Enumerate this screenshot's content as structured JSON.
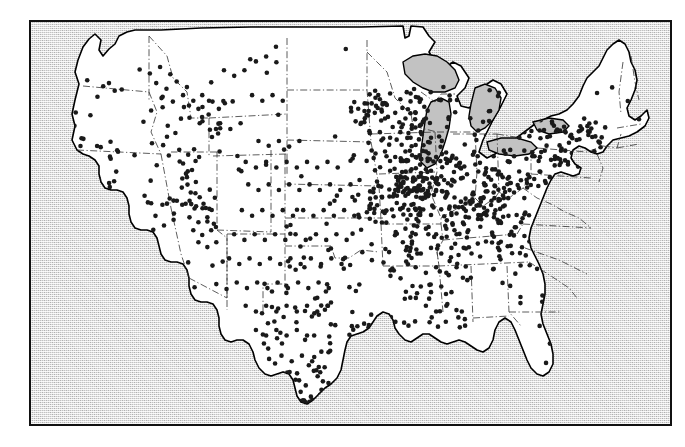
{
  "figure": {
    "frame": {
      "border_color": "#111111",
      "background_color": "#c2c2c2",
      "land_fill_color": "#ffffff",
      "land_outline_color": "#000000",
      "state_border_color": "#333333",
      "dot_color": "#1a1a1a",
      "dot_radius_px": 2.3
    },
    "legend": {
      "present": false,
      "items": []
    },
    "axes": {
      "present": false
    },
    "labels": {
      "present": false,
      "items": []
    }
  },
  "chart_data": {
    "type": "scatter",
    "subtitle": "",
    "xlabel": "",
    "ylabel": "",
    "grid": false,
    "legend_position": "none",
    "projection": "conic (Albers-like)",
    "extent_note": "Contiguous 48 states; Alaska and Hawaii not shown",
    "total_points": 1180,
    "density_summary": [
      {
        "region": "Upper Midwest / Great Lakes (WI, IL, IN, OH, MI, lower MN, IA)",
        "density": "very high"
      },
      {
        "region": "Ohio Valley / Kentucky / Tennessee",
        "density": "high"
      },
      {
        "region": "Mid-Atlantic / Upstate New York / Pennsylvania",
        "density": "high"
      },
      {
        "region": "Central and Eastern Texas / Gulf Coast",
        "density": "moderate-high"
      },
      {
        "region": "California Central Valley and coast",
        "density": "moderate-high"
      },
      {
        "region": "Missouri / Arkansas / Oklahoma / Kansas",
        "density": "moderate"
      },
      {
        "region": "Utah / Idaho / Colorado Front Range",
        "density": "moderate"
      },
      {
        "region": "Mississippi / Alabama / Louisiana",
        "density": "moderate"
      },
      {
        "region": "Montana / Dakotas / Wyoming / Nevada / Great Basin",
        "density": "low"
      },
      {
        "region": "Florida / Georgia / the Carolinas",
        "density": "low"
      },
      {
        "region": "Northern New England (ME, NH, VT)",
        "density": "very low"
      }
    ],
    "clusters": [
      {
        "name": "Chicago–Milwaukee corridor",
        "approx_x": 0.62,
        "approx_y": 0.36,
        "weight": "very high"
      },
      {
        "name": "Central Illinois / Iowa",
        "approx_x": 0.58,
        "approx_y": 0.44,
        "weight": "very high"
      },
      {
        "name": "Ohio / Indiana",
        "approx_x": 0.7,
        "approx_y": 0.42,
        "weight": "very high"
      },
      {
        "name": "Southern Wisconsin / Minnesota",
        "approx_x": 0.57,
        "approx_y": 0.24,
        "weight": "high"
      },
      {
        "name": "New York / New Jersey metro",
        "approx_x": 0.85,
        "approx_y": 0.3,
        "weight": "high"
      },
      {
        "name": "South Texas / Rio Grande Valley",
        "approx_x": 0.43,
        "approx_y": 0.92,
        "weight": "high"
      },
      {
        "name": "California Bay Area",
        "approx_x": 0.07,
        "approx_y": 0.44,
        "weight": "high"
      },
      {
        "name": "Utah Wasatch Front",
        "approx_x": 0.23,
        "approx_y": 0.43,
        "weight": "moderate"
      }
    ],
    "points": [
      [
        0.088,
        0.145
      ],
      [
        0.113,
        0.16
      ],
      [
        0.122,
        0.152
      ],
      [
        0.131,
        0.171
      ],
      [
        0.104,
        0.186
      ],
      [
        0.142,
        0.168
      ],
      [
        0.07,
        0.225
      ],
      [
        0.093,
        0.232
      ],
      [
        0.068,
        0.258
      ],
      [
        0.054,
        0.3
      ],
      [
        0.06,
        0.318
      ],
      [
        0.072,
        0.33
      ],
      [
        0.049,
        0.34
      ],
      [
        0.063,
        0.352
      ],
      [
        0.078,
        0.344
      ],
      [
        0.055,
        0.366
      ],
      [
        0.07,
        0.378
      ],
      [
        0.086,
        0.37
      ],
      [
        0.046,
        0.392
      ],
      [
        0.062,
        0.404
      ],
      [
        0.079,
        0.398
      ],
      [
        0.094,
        0.388
      ],
      [
        0.053,
        0.418
      ],
      [
        0.068,
        0.43
      ],
      [
        0.084,
        0.424
      ],
      [
        0.1,
        0.414
      ],
      [
        0.058,
        0.444
      ],
      [
        0.074,
        0.456
      ],
      [
        0.09,
        0.45
      ],
      [
        0.106,
        0.44
      ],
      [
        0.064,
        0.47
      ],
      [
        0.08,
        0.482
      ],
      [
        0.096,
        0.476
      ],
      [
        0.112,
        0.466
      ],
      [
        0.072,
        0.496
      ],
      [
        0.088,
        0.508
      ],
      [
        0.104,
        0.502
      ],
      [
        0.12,
        0.492
      ],
      [
        0.082,
        0.522
      ],
      [
        0.098,
        0.534
      ],
      [
        0.114,
        0.528
      ],
      [
        0.092,
        0.548
      ],
      [
        0.108,
        0.56
      ],
      [
        0.124,
        0.554
      ],
      [
        0.104,
        0.576
      ],
      [
        0.12,
        0.588
      ],
      [
        0.136,
        0.582
      ],
      [
        0.118,
        0.604
      ],
      [
        0.134,
        0.616
      ],
      [
        0.15,
        0.61
      ],
      [
        0.132,
        0.632
      ],
      [
        0.148,
        0.644
      ],
      [
        0.146,
        0.664
      ],
      [
        0.162,
        0.672
      ],
      [
        0.158,
        0.692
      ],
      [
        0.174,
        0.7
      ],
      [
        0.172,
        0.718
      ],
      [
        0.186,
        0.726
      ],
      [
        0.196,
        0.742
      ],
      [
        0.188,
        0.22
      ],
      [
        0.206,
        0.212
      ],
      [
        0.176,
        0.248
      ],
      [
        0.214,
        0.258
      ],
      [
        0.226,
        0.276
      ],
      [
        0.232,
        0.318
      ],
      [
        0.246,
        0.33
      ],
      [
        0.238,
        0.352
      ],
      [
        0.252,
        0.368
      ],
      [
        0.244,
        0.386
      ],
      [
        0.258,
        0.398
      ],
      [
        0.236,
        0.412
      ],
      [
        0.25,
        0.424
      ],
      [
        0.264,
        0.436
      ],
      [
        0.242,
        0.452
      ],
      [
        0.256,
        0.464
      ],
      [
        0.27,
        0.452
      ],
      [
        0.248,
        0.486
      ],
      [
        0.262,
        0.498
      ],
      [
        0.276,
        0.486
      ],
      [
        0.254,
        0.518
      ],
      [
        0.268,
        0.53
      ],
      [
        0.282,
        0.518
      ],
      [
        0.262,
        0.548
      ],
      [
        0.276,
        0.56
      ],
      [
        0.29,
        0.548
      ],
      [
        0.246,
        0.598
      ],
      [
        0.284,
        0.606
      ],
      [
        0.3,
        0.596
      ],
      [
        0.216,
        0.648
      ],
      [
        0.256,
        0.66
      ],
      [
        0.29,
        0.652
      ],
      [
        0.306,
        0.664
      ],
      [
        0.17,
        0.118
      ],
      [
        0.186,
        0.128
      ],
      [
        0.202,
        0.112
      ],
      [
        0.218,
        0.13
      ],
      [
        0.196,
        0.152
      ],
      [
        0.212,
        0.166
      ],
      [
        0.228,
        0.148
      ],
      [
        0.244,
        0.162
      ],
      [
        0.206,
        0.186
      ],
      [
        0.222,
        0.198
      ],
      [
        0.238,
        0.182
      ],
      [
        0.254,
        0.196
      ],
      [
        0.268,
        0.182
      ],
      [
        0.284,
        0.198
      ],
      [
        0.262,
        0.216
      ],
      [
        0.278,
        0.23
      ],
      [
        0.294,
        0.216
      ],
      [
        0.248,
        0.238
      ],
      [
        0.264,
        0.252
      ],
      [
        0.28,
        0.268
      ],
      [
        0.296,
        0.252
      ],
      [
        0.312,
        0.266
      ],
      [
        0.328,
        0.252
      ],
      [
        0.302,
        0.12
      ],
      [
        0.318,
        0.134
      ],
      [
        0.334,
        0.12
      ],
      [
        0.352,
        0.098
      ],
      [
        0.368,
        0.086
      ],
      [
        0.384,
        0.1
      ],
      [
        0.346,
        0.182
      ],
      [
        0.362,
        0.196
      ],
      [
        0.378,
        0.182
      ],
      [
        0.394,
        0.196
      ],
      [
        0.356,
        0.296
      ],
      [
        0.372,
        0.308
      ],
      [
        0.388,
        0.296
      ],
      [
        0.404,
        0.31
      ],
      [
        0.42,
        0.296
      ],
      [
        0.336,
        0.348
      ],
      [
        0.352,
        0.362
      ],
      [
        0.368,
        0.348
      ],
      [
        0.384,
        0.362
      ],
      [
        0.4,
        0.348
      ],
      [
        0.416,
        0.362
      ],
      [
        0.432,
        0.348
      ],
      [
        0.448,
        0.362
      ],
      [
        0.464,
        0.348
      ],
      [
        0.48,
        0.362
      ],
      [
        0.34,
        0.404
      ],
      [
        0.356,
        0.418
      ],
      [
        0.372,
        0.404
      ],
      [
        0.388,
        0.418
      ],
      [
        0.404,
        0.404
      ],
      [
        0.42,
        0.418
      ],
      [
        0.436,
        0.404
      ],
      [
        0.452,
        0.418
      ],
      [
        0.468,
        0.404
      ],
      [
        0.484,
        0.418
      ],
      [
        0.5,
        0.404
      ],
      [
        0.33,
        0.468
      ],
      [
        0.346,
        0.482
      ],
      [
        0.362,
        0.468
      ],
      [
        0.378,
        0.482
      ],
      [
        0.394,
        0.468
      ],
      [
        0.41,
        0.482
      ],
      [
        0.426,
        0.468
      ],
      [
        0.442,
        0.482
      ],
      [
        0.458,
        0.468
      ],
      [
        0.474,
        0.482
      ],
      [
        0.49,
        0.468
      ],
      [
        0.506,
        0.482
      ],
      [
        0.318,
        0.528
      ],
      [
        0.334,
        0.542
      ],
      [
        0.35,
        0.528
      ],
      [
        0.366,
        0.542
      ],
      [
        0.382,
        0.528
      ],
      [
        0.398,
        0.542
      ],
      [
        0.414,
        0.528
      ],
      [
        0.43,
        0.542
      ],
      [
        0.446,
        0.528
      ],
      [
        0.462,
        0.542
      ],
      [
        0.478,
        0.528
      ],
      [
        0.494,
        0.542
      ],
      [
        0.31,
        0.588
      ],
      [
        0.326,
        0.602
      ],
      [
        0.342,
        0.588
      ],
      [
        0.358,
        0.602
      ],
      [
        0.374,
        0.588
      ],
      [
        0.39,
        0.602
      ],
      [
        0.406,
        0.588
      ],
      [
        0.422,
        0.602
      ],
      [
        0.438,
        0.588
      ],
      [
        0.454,
        0.602
      ],
      [
        0.47,
        0.588
      ],
      [
        0.486,
        0.602
      ],
      [
        0.322,
        0.648
      ],
      [
        0.338,
        0.662
      ],
      [
        0.354,
        0.648
      ],
      [
        0.37,
        0.662
      ],
      [
        0.386,
        0.648
      ],
      [
        0.402,
        0.662
      ],
      [
        0.418,
        0.648
      ],
      [
        0.434,
        0.662
      ],
      [
        0.45,
        0.648
      ],
      [
        0.466,
        0.662
      ],
      [
        0.336,
        0.706
      ],
      [
        0.352,
        0.72
      ],
      [
        0.368,
        0.706
      ],
      [
        0.384,
        0.72
      ],
      [
        0.4,
        0.706
      ],
      [
        0.416,
        0.72
      ],
      [
        0.432,
        0.706
      ],
      [
        0.448,
        0.72
      ],
      [
        0.464,
        0.706
      ],
      [
        0.352,
        0.766
      ],
      [
        0.368,
        0.78
      ],
      [
        0.384,
        0.766
      ],
      [
        0.4,
        0.78
      ],
      [
        0.416,
        0.766
      ],
      [
        0.432,
        0.78
      ],
      [
        0.392,
        0.83
      ],
      [
        0.408,
        0.844
      ],
      [
        0.424,
        0.83
      ],
      [
        0.44,
        0.844
      ],
      [
        0.414,
        0.89
      ],
      [
        0.43,
        0.904
      ],
      [
        0.422,
        0.92
      ],
      [
        0.438,
        0.932
      ],
      [
        0.43,
        0.946
      ],
      [
        0.53,
        0.18
      ],
      [
        0.546,
        0.192
      ],
      [
        0.562,
        0.178
      ],
      [
        0.578,
        0.192
      ],
      [
        0.594,
        0.178
      ],
      [
        0.61,
        0.192
      ],
      [
        0.538,
        0.226
      ],
      [
        0.554,
        0.24
      ],
      [
        0.57,
        0.226
      ],
      [
        0.586,
        0.24
      ],
      [
        0.602,
        0.226
      ],
      [
        0.618,
        0.24
      ],
      [
        0.546,
        0.274
      ],
      [
        0.562,
        0.288
      ],
      [
        0.578,
        0.274
      ],
      [
        0.594,
        0.288
      ],
      [
        0.61,
        0.274
      ],
      [
        0.626,
        0.288
      ],
      [
        0.554,
        0.322
      ],
      [
        0.57,
        0.336
      ],
      [
        0.586,
        0.322
      ],
      [
        0.602,
        0.336
      ],
      [
        0.618,
        0.322
      ],
      [
        0.634,
        0.336
      ],
      [
        0.562,
        0.37
      ],
      [
        0.578,
        0.384
      ],
      [
        0.594,
        0.37
      ],
      [
        0.61,
        0.384
      ],
      [
        0.626,
        0.37
      ],
      [
        0.642,
        0.384
      ],
      [
        0.57,
        0.418
      ],
      [
        0.586,
        0.432
      ],
      [
        0.602,
        0.418
      ],
      [
        0.618,
        0.432
      ],
      [
        0.634,
        0.418
      ],
      [
        0.65,
        0.432
      ],
      [
        0.578,
        0.466
      ],
      [
        0.594,
        0.48
      ],
      [
        0.61,
        0.466
      ],
      [
        0.626,
        0.48
      ],
      [
        0.642,
        0.466
      ],
      [
        0.658,
        0.48
      ],
      [
        0.586,
        0.514
      ],
      [
        0.602,
        0.528
      ],
      [
        0.618,
        0.514
      ],
      [
        0.634,
        0.528
      ],
      [
        0.65,
        0.514
      ],
      [
        0.666,
        0.528
      ],
      [
        0.594,
        0.562
      ],
      [
        0.61,
        0.576
      ],
      [
        0.626,
        0.562
      ],
      [
        0.642,
        0.576
      ],
      [
        0.658,
        0.562
      ],
      [
        0.602,
        0.61
      ],
      [
        0.618,
        0.624
      ],
      [
        0.634,
        0.61
      ],
      [
        0.65,
        0.624
      ],
      [
        0.666,
        0.61
      ],
      [
        0.61,
        0.658
      ],
      [
        0.626,
        0.672
      ],
      [
        0.642,
        0.658
      ],
      [
        0.658,
        0.672
      ],
      [
        0.618,
        0.706
      ],
      [
        0.634,
        0.72
      ],
      [
        0.65,
        0.706
      ],
      [
        0.7,
        0.27
      ],
      [
        0.716,
        0.284
      ],
      [
        0.732,
        0.27
      ],
      [
        0.748,
        0.284
      ],
      [
        0.764,
        0.27
      ],
      [
        0.78,
        0.284
      ],
      [
        0.796,
        0.27
      ],
      [
        0.812,
        0.284
      ],
      [
        0.828,
        0.27
      ],
      [
        0.844,
        0.284
      ],
      [
        0.86,
        0.27
      ],
      [
        0.708,
        0.32
      ],
      [
        0.724,
        0.334
      ],
      [
        0.74,
        0.32
      ],
      [
        0.756,
        0.334
      ],
      [
        0.772,
        0.32
      ],
      [
        0.788,
        0.334
      ],
      [
        0.804,
        0.32
      ],
      [
        0.82,
        0.334
      ],
      [
        0.836,
        0.32
      ],
      [
        0.7,
        0.372
      ],
      [
        0.716,
        0.386
      ],
      [
        0.732,
        0.372
      ],
      [
        0.748,
        0.386
      ],
      [
        0.764,
        0.372
      ],
      [
        0.78,
        0.386
      ],
      [
        0.796,
        0.372
      ],
      [
        0.812,
        0.386
      ],
      [
        0.692,
        0.424
      ],
      [
        0.708,
        0.438
      ],
      [
        0.724,
        0.424
      ],
      [
        0.74,
        0.438
      ],
      [
        0.756,
        0.424
      ],
      [
        0.772,
        0.438
      ],
      [
        0.7,
        0.48
      ],
      [
        0.73,
        0.492
      ],
      [
        0.76,
        0.48
      ],
      [
        0.79,
        0.492
      ],
      [
        0.712,
        0.546
      ],
      [
        0.746,
        0.558
      ],
      [
        0.78,
        0.546
      ],
      [
        0.724,
        0.614
      ],
      [
        0.758,
        0.626
      ],
      [
        0.792,
        0.614
      ],
      [
        0.766,
        0.684
      ],
      [
        0.8,
        0.696
      ],
      [
        0.796,
        0.756
      ],
      [
        0.812,
        0.8
      ],
      [
        0.806,
        0.848
      ]
    ]
  },
  "geography": {
    "landmass_name": "Contiguous United States",
    "lakes_shown": [
      "Lake Superior",
      "Lake Michigan",
      "Lake Huron",
      "Lake Erie",
      "Lake Ontario"
    ],
    "state_borders_shown": true
  }
}
